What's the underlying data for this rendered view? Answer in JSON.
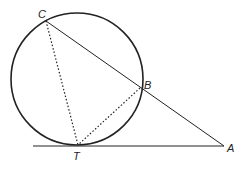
{
  "diagram": {
    "points": {
      "C": {
        "label": "C"
      },
      "B": {
        "label": "B"
      },
      "T": {
        "label": "T"
      },
      "A": {
        "label": "A"
      }
    },
    "elements": [
      {
        "type": "circle",
        "name": "circle"
      },
      {
        "type": "segment",
        "from": "C",
        "to": "A",
        "style": "solid",
        "name": "secant-CA"
      },
      {
        "type": "segment",
        "from": "T",
        "to": "A",
        "style": "solid",
        "name": "tangent-TA"
      },
      {
        "type": "segment",
        "from": "C",
        "to": "T",
        "style": "dotted",
        "name": "chord-CT"
      },
      {
        "type": "segment",
        "from": "B",
        "to": "T",
        "style": "dotted",
        "name": "chord-BT"
      }
    ],
    "colors": {
      "stroke": "#222222",
      "background": "#ffffff"
    }
  }
}
